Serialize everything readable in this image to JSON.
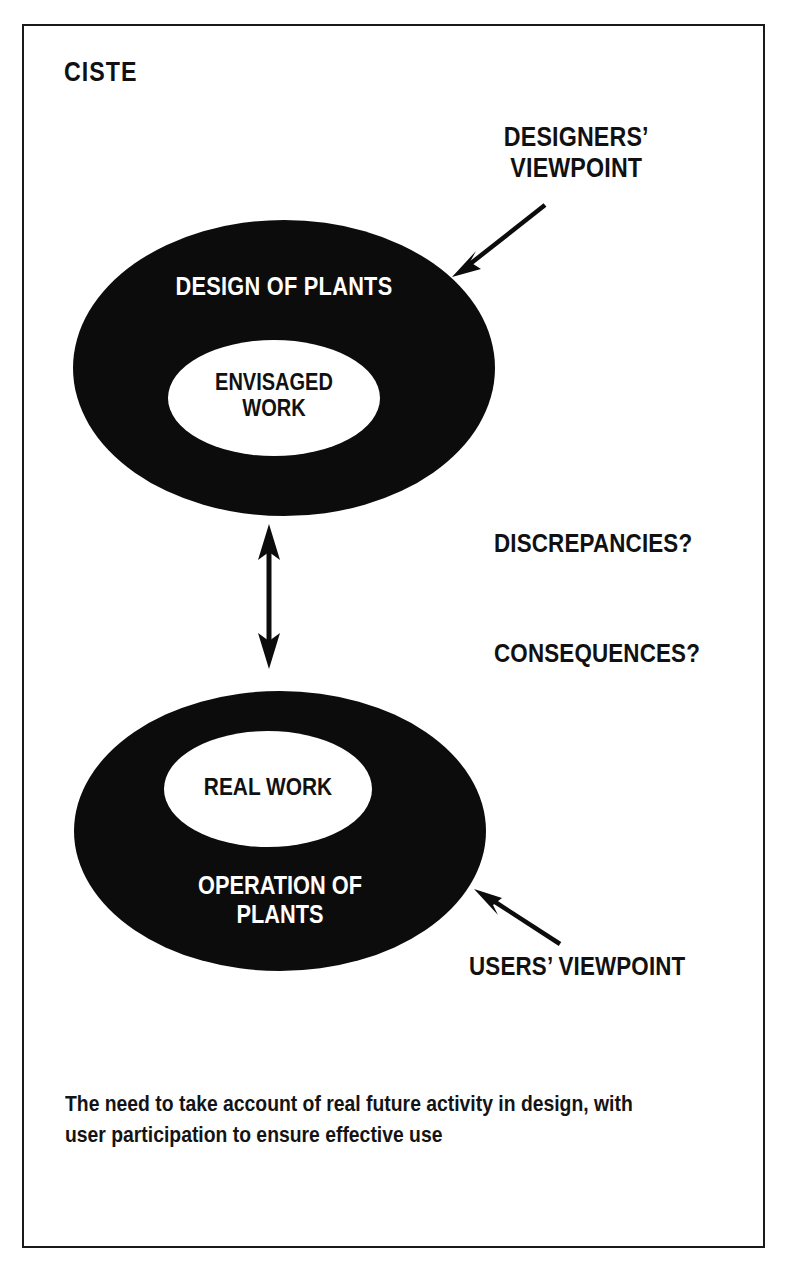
{
  "page": {
    "title": "CISTE",
    "background": "#ffffff",
    "ink": "#111111",
    "frame_color": "#1a1a1a"
  },
  "diagram": {
    "top_ellipse": {
      "outer_label": "DESIGN OF PLANTS",
      "inner_label_line1": "ENVISAGED",
      "inner_label_line2": "WORK",
      "fill": "#0c0c0c",
      "inner_fill": "#ffffff"
    },
    "bottom_ellipse": {
      "inner_label": "REAL WORK",
      "outer_label_line1": "OPERATION OF",
      "outer_label_line2": "PLANTS",
      "fill": "#0c0c0c",
      "inner_fill": "#ffffff"
    },
    "annotations": {
      "designers_viewpoint_line1": "DESIGNERS’",
      "designers_viewpoint_line2": "VIEWPOINT",
      "users_viewpoint": "USERS’ VIEWPOINT",
      "discrepancies": "DISCREPANCIES?",
      "consequences": "CONSEQUENCES?"
    },
    "connector": {
      "name": "double-headed-vertical-arrow",
      "color": "#0c0c0c"
    }
  },
  "caption": {
    "line1": "The need to take account of real future activity in design, with",
    "line2": "user participation to ensure effective use"
  }
}
